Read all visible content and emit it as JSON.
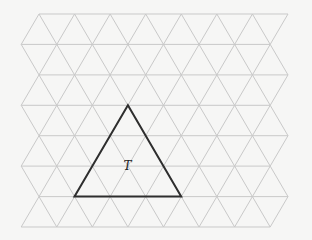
{
  "diagram": {
    "type": "triangular-grid",
    "grid": {
      "rows": 8,
      "row_y": [
        14,
        44.4,
        74.9,
        105.3,
        135.7,
        166.1,
        196.6,
        227
      ],
      "even_row_x": [
        39,
        288
      ],
      "odd_row_x": [
        21.2,
        270.2
      ],
      "cell_side": 35.57,
      "line_color": "#c9c9c9"
    },
    "highlighted_triangle": {
      "label": "T",
      "vertices": [
        [
          127.9,
          105.3
        ],
        [
          74.5,
          196.6
        ],
        [
          181.2,
          196.6
        ]
      ],
      "label_pos": [
        127.5,
        170
      ],
      "stroke_color": "#2e2e2e"
    },
    "background": "#f6f6f5"
  }
}
